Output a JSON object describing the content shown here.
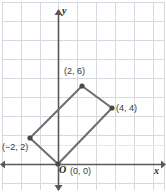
{
  "figure": {
    "name": "coordinate-plane-parallelogram",
    "width": 166,
    "height": 192,
    "background_color": "#ffffff"
  },
  "axes": {
    "x_label": "x",
    "y_label": "y",
    "origin_label": "O",
    "axis_color": "#595959",
    "grid_color": "#d8d8e0",
    "x_axis_pixel_y": 164,
    "y_axis_pixel_x": 58,
    "grid_spacing_px": 19,
    "unit_px": 13,
    "x_range_units": [
      -4.3,
      8.3
    ],
    "y_range_units": [
      -2.2,
      12.6
    ],
    "arrows": [
      "x-positive",
      "y-positive",
      "y-negative",
      "x-negative"
    ]
  },
  "shape": {
    "type": "parallelogram",
    "fill": "none",
    "stroke_color": "#6e6e6e",
    "stroke_width": 2,
    "vertex_dot_color": "#4a4a4a",
    "vertex_dot_radius": 2.6,
    "vertices": [
      {
        "name": "origin-vertex",
        "label": "(0, 0)",
        "x": 0,
        "y": 0,
        "px": 58,
        "py": 164
      },
      {
        "name": "left-vertex",
        "label": "(−2, 2)",
        "x": -2,
        "y": 2,
        "px": 30,
        "py": 138
      },
      {
        "name": "top-vertex",
        "label": "(2, 6)",
        "x": 2,
        "y": 6,
        "px": 82,
        "py": 86
      },
      {
        "name": "right-vertex",
        "label": "(4, 4)",
        "x": 4,
        "y": 4,
        "px": 112,
        "py": 108
      }
    ],
    "edges": [
      [
        "origin-vertex",
        "left-vertex"
      ],
      [
        "left-vertex",
        "top-vertex"
      ],
      [
        "top-vertex",
        "right-vertex"
      ],
      [
        "right-vertex",
        "origin-vertex"
      ]
    ]
  },
  "labels": {
    "top_vertex": "(2, 6)",
    "right_vertex": "(4, 4)",
    "left_vertex": "(−2, 2)",
    "origin_vertex": "(0, 0)",
    "origin_marker": "O",
    "x_axis": "x",
    "y_axis": "y"
  },
  "chart_data": {
    "type": "scatter",
    "title": "",
    "xlabel": "x",
    "ylabel": "y",
    "xlim": [
      -4.3,
      8.3
    ],
    "ylim": [
      -2.2,
      12.6
    ],
    "grid": true,
    "legend": "none",
    "series": [
      {
        "name": "parallelogram-vertices",
        "points": [
          {
            "x": 0,
            "y": 0,
            "label": "(0, 0)"
          },
          {
            "x": -2,
            "y": 2,
            "label": "(−2, 2)"
          },
          {
            "x": 2,
            "y": 6,
            "label": "(2, 6)"
          },
          {
            "x": 4,
            "y": 4,
            "label": "(4, 4)"
          }
        ],
        "closed_polygon": true
      }
    ],
    "annotations": [
      {
        "text": "O",
        "x": 0,
        "y": 0
      },
      {
        "text": "x",
        "x": 7.8,
        "y": 0
      },
      {
        "text": "y",
        "x": 0,
        "y": 12.2
      }
    ]
  }
}
